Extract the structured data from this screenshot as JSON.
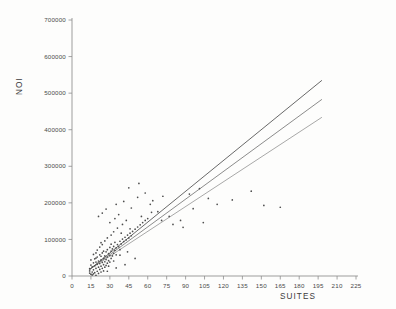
{
  "chart_data": {
    "type": "scatter",
    "title": "",
    "subtitle": "",
    "xlabel": "SUITES",
    "ylabel": "NOI",
    "xlim": [
      0,
      225
    ],
    "ylim": [
      0,
      700000
    ],
    "grid": false,
    "legend": "none",
    "x_ticks": [
      0,
      15,
      30,
      45,
      60,
      75,
      90,
      105,
      120,
      135,
      150,
      165,
      180,
      195,
      210,
      225
    ],
    "x_tick_labels": [
      "0",
      "15",
      "30",
      "45",
      "60",
      "75",
      "90",
      "105",
      "120",
      "135",
      "150",
      "165",
      "180",
      "195",
      "210",
      "225"
    ],
    "y_ticks": [
      0,
      100000,
      200000,
      300000,
      400000,
      500000,
      600000,
      700000
    ],
    "y_tick_labels": [
      "0",
      "100000",
      "200000",
      "300000",
      "400000",
      "500000",
      "600000",
      "700000"
    ],
    "points": [
      [
        14,
        14000
      ],
      [
        14,
        8000
      ],
      [
        14,
        20000
      ],
      [
        15,
        5000
      ],
      [
        15,
        30000
      ],
      [
        15,
        44000
      ],
      [
        16,
        11000
      ],
      [
        16,
        25000
      ],
      [
        16,
        3000
      ],
      [
        17,
        36000
      ],
      [
        17,
        17000
      ],
      [
        17,
        6000
      ],
      [
        18,
        28000
      ],
      [
        18,
        47000
      ],
      [
        18,
        9000
      ],
      [
        19,
        21000
      ],
      [
        19,
        38000
      ],
      [
        19,
        2000
      ],
      [
        20,
        32000
      ],
      [
        20,
        13000
      ],
      [
        20,
        52000
      ],
      [
        21,
        24000
      ],
      [
        21,
        41000
      ],
      [
        21,
        7000
      ],
      [
        22,
        34000
      ],
      [
        22,
        18000
      ],
      [
        22,
        58000
      ],
      [
        23,
        44000
      ],
      [
        23,
        27000
      ],
      [
        23,
        11000
      ],
      [
        24,
        37000
      ],
      [
        24,
        63000
      ],
      [
        24,
        21000
      ],
      [
        25,
        48000
      ],
      [
        25,
        31000
      ],
      [
        25,
        14000
      ],
      [
        26,
        55000
      ],
      [
        26,
        39000
      ],
      [
        26,
        24000
      ],
      [
        27,
        66000
      ],
      [
        27,
        45000
      ],
      [
        27,
        29000
      ],
      [
        28,
        52000
      ],
      [
        28,
        35000
      ],
      [
        28,
        72000
      ],
      [
        29,
        61000
      ],
      [
        29,
        42000
      ],
      [
        29,
        27000
      ],
      [
        30,
        56000
      ],
      [
        30,
        78000
      ],
      [
        30,
        38000
      ],
      [
        31,
        68000
      ],
      [
        31,
        48000
      ],
      [
        32,
        74000
      ],
      [
        32,
        55000
      ],
      [
        33,
        81000
      ],
      [
        33,
        62000
      ],
      [
        34,
        70000
      ],
      [
        34,
        92000
      ],
      [
        35,
        77000
      ],
      [
        35,
        58000
      ],
      [
        36,
        86000
      ],
      [
        37,
        80000
      ],
      [
        38,
        95000
      ],
      [
        38,
        72000
      ],
      [
        39,
        88000
      ],
      [
        40,
        101000
      ],
      [
        41,
        94000
      ],
      [
        42,
        106000
      ],
      [
        43,
        99000
      ],
      [
        44,
        112000
      ],
      [
        45,
        104000
      ],
      [
        46,
        117000
      ],
      [
        47,
        110000
      ],
      [
        48,
        122000
      ],
      [
        50,
        128000
      ],
      [
        52,
        134000
      ],
      [
        54,
        140000
      ],
      [
        56,
        146000
      ],
      [
        58,
        152000
      ],
      [
        60,
        157000
      ],
      [
        19,
        63000
      ],
      [
        22,
        79000
      ],
      [
        24,
        86000
      ],
      [
        26,
        96000
      ],
      [
        28,
        104000
      ],
      [
        31,
        112000
      ],
      [
        33,
        121000
      ],
      [
        36,
        131000
      ],
      [
        20,
        71000
      ],
      [
        23,
        91000
      ],
      [
        30,
        146000
      ],
      [
        34,
        157000
      ],
      [
        37,
        168000
      ],
      [
        40,
        141000
      ],
      [
        43,
        152000
      ],
      [
        47,
        186000
      ],
      [
        52,
        215000
      ],
      [
        58,
        227000
      ],
      [
        64,
        206000
      ],
      [
        72,
        218000
      ],
      [
        27,
        183000
      ],
      [
        35,
        196000
      ],
      [
        41,
        204000
      ],
      [
        24,
        172000
      ],
      [
        21,
        163000
      ],
      [
        45,
        241000
      ],
      [
        53,
        253000
      ],
      [
        62,
        196000
      ],
      [
        68,
        176000
      ],
      [
        77,
        163000
      ],
      [
        86,
        152000
      ],
      [
        93,
        224000
      ],
      [
        101,
        239000
      ],
      [
        108,
        212000
      ],
      [
        96,
        184000
      ],
      [
        115,
        196000
      ],
      [
        127,
        208000
      ],
      [
        142,
        232000
      ],
      [
        152,
        193000
      ],
      [
        165,
        188000
      ],
      [
        38,
        57000
      ],
      [
        44,
        66000
      ],
      [
        50,
        48000
      ],
      [
        33,
        41000
      ],
      [
        28,
        13000
      ],
      [
        35,
        22000
      ],
      [
        42,
        31000
      ],
      [
        23,
        54000
      ],
      [
        19,
        49000
      ],
      [
        17,
        59000
      ],
      [
        25,
        68000
      ],
      [
        31,
        87000
      ],
      [
        39,
        117000
      ],
      [
        46,
        129000
      ],
      [
        55,
        163000
      ],
      [
        63,
        174000
      ],
      [
        71,
        152000
      ],
      [
        80,
        141000
      ],
      [
        88,
        133000
      ],
      [
        104,
        146000
      ]
    ],
    "series": [
      {
        "name": "fit-upper",
        "type": "line",
        "x": [
          14,
          198
        ],
        "y": [
          18000,
          535000
        ]
      },
      {
        "name": "fit-middle",
        "type": "line",
        "x": [
          14,
          198
        ],
        "y": [
          18000,
          483000
        ]
      },
      {
        "name": "fit-lower",
        "type": "line",
        "x": [
          14,
          198
        ],
        "y": [
          18000,
          434000
        ]
      }
    ]
  }
}
